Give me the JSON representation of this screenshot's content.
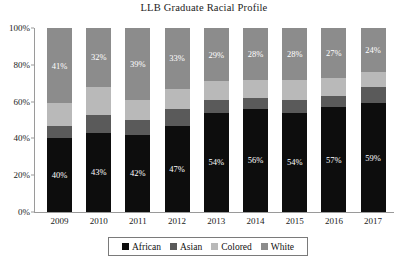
{
  "chart_data": {
    "type": "bar",
    "subtype": "stacked-column-100",
    "title": "LLB Graduate Racial Profile",
    "xlabel": "",
    "ylabel": "",
    "ylim": [
      0,
      100
    ],
    "ytick_labels": [
      "100%",
      "80%",
      "60%",
      "40%",
      "20%",
      "0%"
    ],
    "ytick_values": [
      100,
      80,
      60,
      40,
      20,
      0
    ],
    "grid": false,
    "legend_position": "bottom",
    "categories": [
      "2009",
      "2010",
      "2011",
      "2012",
      "2013",
      "2014",
      "2015",
      "2016",
      "2017"
    ],
    "series": [
      {
        "name": "African",
        "color": "#0d0d0d",
        "values": [
          40,
          43,
          42,
          47,
          54,
          56,
          54,
          57,
          59
        ],
        "labels": [
          "40%",
          "43%",
          "42%",
          "47%",
          "54%",
          "56%",
          "54%",
          "57%",
          "59%"
        ],
        "labels_shown": true
      },
      {
        "name": "Asian",
        "color": "#5a5a5a",
        "values": [
          7,
          10,
          8,
          9,
          7,
          6,
          7,
          6,
          9
        ],
        "labels": [
          "",
          "",
          "",
          "",
          "",
          "",
          "",
          "",
          ""
        ],
        "labels_shown": false
      },
      {
        "name": "Colored",
        "color": "#b9b9b9",
        "values": [
          12,
          15,
          11,
          11,
          10,
          10,
          11,
          10,
          8
        ],
        "labels": [
          "",
          "",
          "",
          "",
          "",
          "",
          "",
          "",
          ""
        ],
        "labels_shown": false
      },
      {
        "name": "White",
        "color": "#8c8c8c",
        "values": [
          41,
          32,
          39,
          33,
          29,
          28,
          28,
          27,
          24
        ],
        "labels": [
          "41%",
          "32%",
          "39%",
          "33%",
          "29%",
          "28%",
          "28%",
          "27%",
          "24%"
        ],
        "labels_shown": true
      }
    ],
    "legend": [
      {
        "label": "African",
        "color": "#0d0d0d"
      },
      {
        "label": "Asian",
        "color": "#5a5a5a"
      },
      {
        "label": "Colored",
        "color": "#b9b9b9"
      },
      {
        "label": "White",
        "color": "#8c8c8c"
      }
    ]
  }
}
